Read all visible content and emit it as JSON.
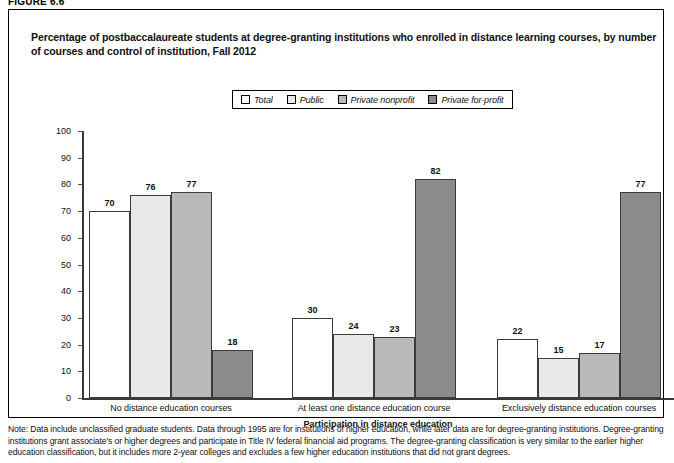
{
  "figure_label": "FIGURE 6.6",
  "title": "Percentage of postbaccalaureate students at degree-granting institutions who enrolled in distance learning courses, by number of courses and control of institution, Fall 2012",
  "chart_data": {
    "type": "bar",
    "title": "Percentage of postbaccalaureate students at degree-granting institutions who enrolled in distance learning courses, by number of courses and control of institution, Fall 2012",
    "xlabel": "Participation in distance education",
    "ylabel": "Percent",
    "ylim": [
      0,
      100
    ],
    "ytick_step": 10,
    "yticks": [
      100,
      90,
      80,
      70,
      60,
      50,
      40,
      30,
      20,
      10,
      0
    ],
    "grid": false,
    "legend_position": "top-center",
    "categories": [
      "No distance education courses",
      "At least one distance education course",
      "Exclusively distance education courses"
    ],
    "series": [
      {
        "name": "Total",
        "color": "#ffffff",
        "values": [
          70,
          30,
          22
        ]
      },
      {
        "name": "Public",
        "color": "#e9e9e9",
        "values": [
          76,
          24,
          15
        ]
      },
      {
        "name": "Private nonprofit",
        "color": "#b9b9b9",
        "values": [
          77,
          23,
          17
        ]
      },
      {
        "name": "Private for-profit",
        "color": "#8b8b8b",
        "values": [
          18,
          82,
          77
        ]
      }
    ]
  },
  "note": {
    "text": "Note: Data include unclassified graduate students. Data through 1995 are for institutions of higher education, while later data are for degree-granting institutions. Degree-granting institutions grant associate's or higher degrees and participate in Title IV federal financial aid programs. The degree-granting classification is very similar to the earlier higher education classification, but it includes more 2-year colleges and excludes a few higher education institutions that did not grant degrees."
  }
}
